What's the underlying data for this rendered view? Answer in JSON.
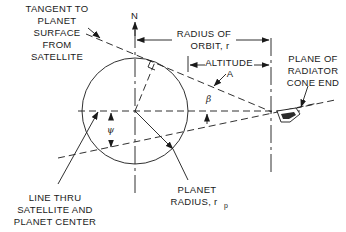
{
  "diagram": {
    "north_label": "N",
    "labels": {
      "tangent": [
        "TANGENT TO",
        "PLANET",
        "SURFACE",
        "FROM",
        "SATELLITE"
      ],
      "radius_of_orbit": [
        "RADIUS OF",
        "ORBIT, r"
      ],
      "altitude": [
        "ALTITUDE",
        "A"
      ],
      "plane_of_radiator": [
        "PLANE OF",
        "RADIATOR",
        "CONE END"
      ],
      "line_thru": [
        "LINE THRU",
        "SATELLITE AND",
        "PLANET CENTER"
      ],
      "planet_radius": [
        "PLANET",
        "RADIUS, r"
      ],
      "planet_radius_subscript": "p"
    },
    "angles": {
      "beta": "β",
      "psi": "ψ"
    }
  }
}
